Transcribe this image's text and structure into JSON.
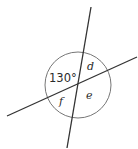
{
  "diagram": {
    "type": "intersecting-lines-angles",
    "angle_given": "130°",
    "labels": {
      "given": "130°",
      "d": "d",
      "e": "e",
      "f": "f"
    },
    "colors": {
      "line": "#333333",
      "circle": "#666666",
      "text": "#2a2a2a"
    }
  }
}
